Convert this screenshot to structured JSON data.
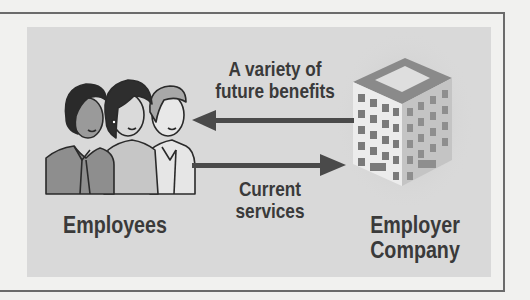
{
  "diagram": {
    "type": "flow",
    "nodes": [
      {
        "id": "employees",
        "label": "Employees",
        "icon": "people-group-icon"
      },
      {
        "id": "employer",
        "label_line1": "Employer",
        "label_line2": "Company",
        "icon": "office-building-icon"
      }
    ],
    "edges": [
      {
        "from": "employer",
        "to": "employees",
        "label_line1": "A variety of",
        "label_line2": "future benefits"
      },
      {
        "from": "employees",
        "to": "employer",
        "label_line1": "Current",
        "label_line2": "services"
      }
    ]
  },
  "colors": {
    "background": "#f1f1ef",
    "panel": "#d9d9d9",
    "frame": "#6b6b6b",
    "arrow": "#4a4a4a",
    "text": "#3a3a3a"
  }
}
